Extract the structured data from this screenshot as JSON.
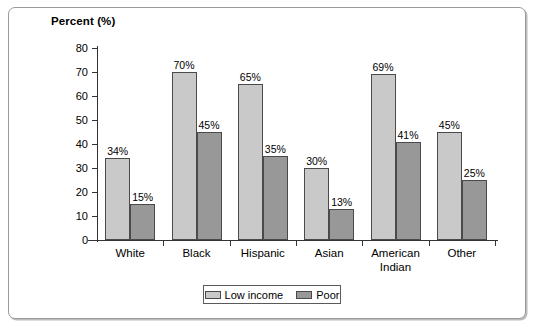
{
  "chart_data": {
    "type": "bar",
    "title": "",
    "ylabel": "Percent (%)",
    "xlabel": "",
    "ylim": [
      0,
      80
    ],
    "yticks": [
      0,
      10,
      20,
      30,
      40,
      50,
      60,
      70,
      80
    ],
    "grid": false,
    "legend_position": "bottom-center",
    "categories": [
      "White",
      "Black",
      "Hispanic",
      "Asian",
      "American\nIndian",
      "Other"
    ],
    "series": [
      {
        "name": "Low income",
        "color": "#c9c9c9",
        "values": [
          34,
          70,
          65,
          30,
          69,
          45
        ],
        "labels": [
          "34%",
          "70%",
          "65%",
          "30%",
          "69%",
          "45%"
        ]
      },
      {
        "name": "Poor",
        "color": "#989898",
        "values": [
          15,
          45,
          35,
          13,
          41,
          25
        ],
        "labels": [
          "15%",
          "45%",
          "35%",
          "13%",
          "41%",
          "25%"
        ]
      }
    ]
  },
  "legend": {
    "entries": [
      {
        "label": "Low income",
        "swatch": "low"
      },
      {
        "label": "Poor",
        "swatch": "poor"
      }
    ]
  }
}
